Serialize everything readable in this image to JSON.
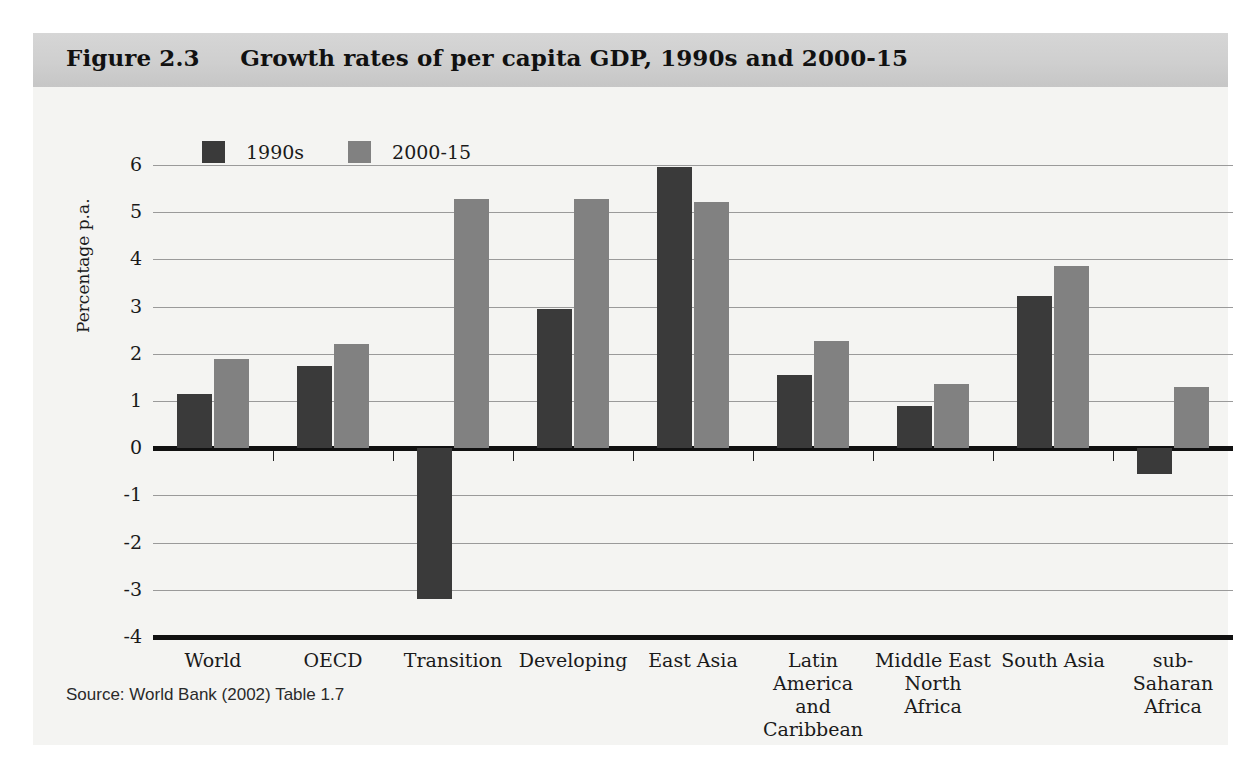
{
  "figure": {
    "title": "Figure 2.3     Growth rates of per capita GDP, 1990s and 2000-15",
    "source": "Source: World Bank (2002) Table 1.7",
    "colors": {
      "series_1990s": "#3a3a3a",
      "series_2000_15": "#818181",
      "title_band": "#cfcfcf",
      "panel": "#f4f4f2",
      "axis": "#111111",
      "gridline": "#9a9a9a"
    }
  },
  "chart_data": {
    "type": "bar",
    "title": "Growth rates of per capita GDP, 1990s and 2000-15",
    "xlabel": "",
    "ylabel": "Percentage p.a.",
    "ylim": [
      -4,
      6
    ],
    "yticks": [
      6,
      5,
      4,
      3,
      2,
      1,
      0,
      -1,
      -2,
      -3,
      -4
    ],
    "ytick_labels": [
      "6",
      "5",
      "4",
      "3",
      "2",
      "1",
      "0",
      "-1",
      "-2",
      "-3",
      "-4"
    ],
    "grid": true,
    "legend_position": "top-left",
    "categories": [
      "World",
      "OECD",
      "Transition",
      "Developing",
      "East Asia",
      "Latin\nAmerica\nand Caribbean",
      "Middle East\nNorth Africa",
      "South Asia",
      "sub-Saharan\nAfrica"
    ],
    "series": [
      {
        "name": "1990s",
        "color": "#3a3a3a",
        "values": [
          1.15,
          1.75,
          -3.2,
          2.95,
          5.95,
          1.55,
          0.9,
          3.22,
          -0.55
        ]
      },
      {
        "name": "2000-15",
        "color": "#818181",
        "values": [
          1.9,
          2.2,
          5.27,
          5.27,
          5.22,
          2.27,
          1.35,
          3.85,
          1.3
        ]
      }
    ]
  }
}
